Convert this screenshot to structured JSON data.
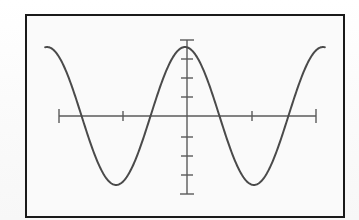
{
  "figure": {
    "caption": "",
    "frame": {
      "border_color": "#1a1a1a",
      "background_color": "#fafafa",
      "page_background": "#fdfdfd",
      "border_width_px": 2
    },
    "style": {
      "curve_color": "#4a4a4a",
      "axis_color": "#5a5a5a",
      "curve_width_px": 2.0,
      "axis_width_px": 1.4,
      "tick_width_px": 1.4
    }
  },
  "chart_data": {
    "type": "line",
    "title": "",
    "subtitle": "",
    "xlabel": "",
    "ylabel": "",
    "grid": false,
    "legend": null,
    "legend_position": "none",
    "function": "y = cos(x)",
    "series": [
      {
        "name": "y = cos(x)",
        "color": "#4a4a4a",
        "x": [
          -6.28,
          -5.9,
          -5.5,
          -5.1,
          -4.71,
          -4.3,
          -3.9,
          -3.5,
          -3.14,
          -2.8,
          -2.4,
          -2.0,
          -1.57,
          -1.2,
          -0.8,
          -0.4,
          0.0,
          0.4,
          0.8,
          1.2,
          1.57,
          2.0,
          2.4,
          2.8,
          3.14,
          3.5,
          3.9,
          4.3,
          4.71,
          5.1,
          5.5,
          5.9,
          6.28
        ],
        "y": [
          1.0,
          0.93,
          0.71,
          0.4,
          0.0,
          -0.42,
          -0.73,
          -0.94,
          -1.0,
          -0.94,
          -0.74,
          -0.42,
          0.0,
          0.36,
          0.7,
          0.92,
          1.0,
          0.92,
          0.7,
          0.36,
          0.0,
          -0.42,
          -0.74,
          -0.94,
          -1.0,
          -0.94,
          -0.73,
          -0.42,
          0.0,
          0.4,
          0.71,
          0.93,
          1.0
        ]
      }
    ],
    "xlim": [
      -7.2,
      7.2
    ],
    "ylim": [
      -1.45,
      1.45
    ],
    "x_axis": {
      "drawn": true,
      "at_y": 0,
      "left_end": -7.2,
      "right_end": 7.2,
      "end_caps": true,
      "tick_values": [
        -3.6,
        3.6
      ],
      "tick_labels": []
    },
    "y_axis": {
      "drawn": true,
      "at_x": 0,
      "bottom_end": -1.45,
      "top_end": 1.45,
      "end_caps": true,
      "tick_values": [
        -1.0,
        -0.5,
        0.5,
        1.0
      ],
      "tick_labels": []
    },
    "annotations": [
      {
        "kind": "maximum",
        "x": -3.14,
        "y": 1.0
      },
      {
        "kind": "maximum",
        "x": 3.14,
        "y": 1.0
      },
      {
        "kind": "minimum",
        "x": 0.0,
        "y": -1.0
      }
    ]
  }
}
